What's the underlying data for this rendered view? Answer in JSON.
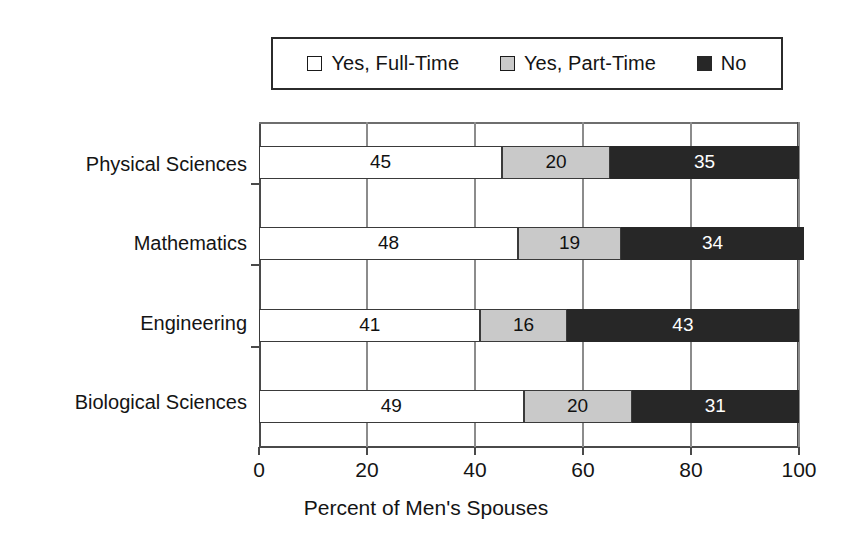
{
  "chart_data": {
    "type": "bar",
    "orientation": "horizontal",
    "stacked": true,
    "title": "",
    "xlabel": "Percent of Men's Spouses",
    "ylabel": "",
    "xlim": [
      0,
      100
    ],
    "xticks": [
      0,
      20,
      40,
      60,
      80,
      100
    ],
    "xtick_labels": [
      "0",
      "20",
      "40",
      "60",
      "80",
      "100"
    ],
    "grid": true,
    "legend_position": "top",
    "categories": [
      "Physical Sciences",
      "Mathematics",
      "Engineering",
      "Biological Sciences"
    ],
    "series": [
      {
        "name": "Yes, Full-Time",
        "color": "#ffffff",
        "values": [
          45,
          48,
          41,
          49
        ]
      },
      {
        "name": "Yes, Part-Time",
        "color": "#c9c9c9",
        "values": [
          20,
          19,
          16,
          20
        ]
      },
      {
        "name": "No",
        "color": "#272727",
        "values": [
          35,
          34,
          43,
          31
        ]
      }
    ]
  },
  "legend": {
    "entries": [
      {
        "label": "Yes, Full-Time",
        "swatch_name": "legend-swatch-full-time"
      },
      {
        "label": "Yes, Part-Time",
        "swatch_name": "legend-swatch-part-time"
      },
      {
        "label": "No",
        "swatch_name": "legend-swatch-no"
      }
    ]
  },
  "axis": {
    "x_title": "Percent of Men's Spouses",
    "x_tick_labels": [
      "0",
      "20",
      "40",
      "60",
      "80",
      "100"
    ],
    "category_labels": [
      "Physical Sciences",
      "Mathematics",
      "Engineering",
      "Biological Sciences"
    ]
  },
  "bar_values": {
    "physical_sciences": {
      "full_time": "45",
      "part_time": "20",
      "no": "35"
    },
    "mathematics": {
      "full_time": "48",
      "part_time": "19",
      "no": "34"
    },
    "engineering": {
      "full_time": "41",
      "part_time": "16",
      "no": "43"
    },
    "biological_sciences": {
      "full_time": "49",
      "part_time": "20",
      "no": "31"
    }
  }
}
